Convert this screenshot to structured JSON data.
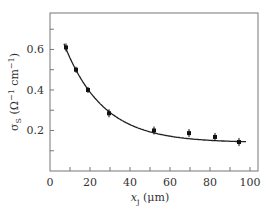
{
  "chart_data": {
    "type": "scatter",
    "title": "",
    "xlabel": "x_j (μm)",
    "ylabel": "σ_S (Ω⁻¹ cm⁻¹)",
    "xlim": [
      0,
      104
    ],
    "ylim": [
      0,
      0.78
    ],
    "x_ticks": [
      0,
      20,
      40,
      60,
      80,
      100
    ],
    "x_minor_ticks": [
      10,
      30,
      50,
      70,
      90
    ],
    "y_ticks": [
      0.2,
      0.4,
      0.6
    ],
    "y_minor_ticks": [
      0.1,
      0.3,
      0.5,
      0.7
    ],
    "grid": false,
    "legend": null,
    "series": [
      {
        "name": "measured",
        "style": "points-with-error-bars",
        "x": [
          8,
          13,
          19,
          29.5,
          52,
          69.5,
          82.5,
          94.5
        ],
        "y": [
          0.61,
          0.5,
          0.4,
          0.285,
          0.2,
          0.187,
          0.168,
          0.143
        ],
        "yerr": [
          0.02,
          0.015,
          0.015,
          0.02,
          0.02,
          0.02,
          0.02,
          0.02
        ]
      },
      {
        "name": "fit",
        "style": "line",
        "model": "a + b*exp(-x/c)",
        "params": {
          "a": 0.14,
          "b": 0.7,
          "c": 19.4
        },
        "x_range": [
          7,
          98
        ]
      }
    ]
  },
  "labels": {
    "x_ticks": [
      "0",
      "20",
      "40",
      "60",
      "80",
      "100"
    ],
    "y_ticks": [
      "0.2",
      "0.4",
      "0.6"
    ],
    "xlabel_main": "x",
    "xlabel_sub": "j",
    "xlabel_unit": " (μm)",
    "ylabel_main": "σ",
    "ylabel_sub": "S",
    "ylabel_unit": " (Ω",
    "ylabel_sup1": "−1",
    "ylabel_mid": " cm",
    "ylabel_sup2": "−1",
    "ylabel_close": ")"
  }
}
